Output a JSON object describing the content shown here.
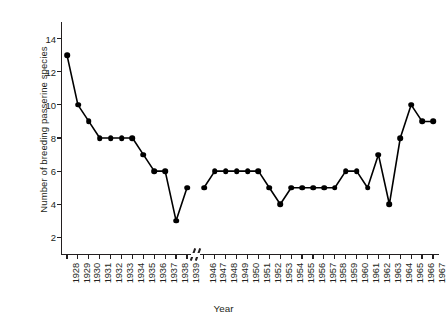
{
  "chart_data": {
    "type": "line",
    "title": "",
    "xlabel": "Year",
    "ylabel": "Number of breeding passerine species",
    "ylim": [
      1,
      15
    ],
    "yticks": [
      2,
      4,
      6,
      8,
      10,
      12,
      14
    ],
    "grid": false,
    "legend": null,
    "axis_break": {
      "after": "1939",
      "before": "1946",
      "symbol": "//"
    },
    "marker": "filled-circle",
    "categories": [
      "1928",
      "1929",
      "1930",
      "1931",
      "1932",
      "1933",
      "1934",
      "1935",
      "1936",
      "1937",
      "1938",
      "1939",
      "1946",
      "1947",
      "1948",
      "1949",
      "1950",
      "1951",
      "1952",
      "1953",
      "1954",
      "1955",
      "1956",
      "1957",
      "1958",
      "1959",
      "1960",
      "1961",
      "1962",
      "1963",
      "1964",
      "1965",
      "1966",
      "1967"
    ],
    "values": [
      13,
      10,
      9,
      8,
      8,
      8,
      8,
      7,
      6,
      6,
      3,
      5,
      5,
      6,
      6,
      6,
      6,
      6,
      5,
      4,
      5,
      5,
      5,
      5,
      5,
      6,
      6,
      5,
      7,
      4,
      8,
      10,
      9,
      9
    ],
    "series": [
      {
        "name": "Number of breeding passerine species",
        "points": [
          {
            "x": "1928",
            "y": 13
          },
          {
            "x": "1929",
            "y": 10
          },
          {
            "x": "1930",
            "y": 9
          },
          {
            "x": "1931",
            "y": 8
          },
          {
            "x": "1932",
            "y": 8
          },
          {
            "x": "1933",
            "y": 8
          },
          {
            "x": "1934",
            "y": 8
          },
          {
            "x": "1935",
            "y": 7
          },
          {
            "x": "1936",
            "y": 6
          },
          {
            "x": "1937",
            "y": 6
          },
          {
            "x": "1938",
            "y": 3
          },
          {
            "x": "1939",
            "y": 5
          },
          {
            "x": "1946",
            "y": 5
          },
          {
            "x": "1947",
            "y": 6
          },
          {
            "x": "1948",
            "y": 6
          },
          {
            "x": "1949",
            "y": 6
          },
          {
            "x": "1950",
            "y": 6
          },
          {
            "x": "1951",
            "y": 6
          },
          {
            "x": "1952",
            "y": 5
          },
          {
            "x": "1953",
            "y": 4
          },
          {
            "x": "1954",
            "y": 5
          },
          {
            "x": "1955",
            "y": 5
          },
          {
            "x": "1956",
            "y": 5
          },
          {
            "x": "1957",
            "y": 5
          },
          {
            "x": "1958",
            "y": 5
          },
          {
            "x": "1959",
            "y": 6
          },
          {
            "x": "1960",
            "y": 6
          },
          {
            "x": "1961",
            "y": 5
          },
          {
            "x": "1962",
            "y": 7
          },
          {
            "x": "1963",
            "y": 4
          },
          {
            "x": "1964",
            "y": 8
          },
          {
            "x": "1965",
            "y": 10
          },
          {
            "x": "1966",
            "y": 9
          },
          {
            "x": "1967",
            "y": 9
          }
        ]
      }
    ]
  }
}
